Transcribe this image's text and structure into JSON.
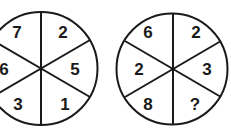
{
  "puzzle": {
    "left_wheel": {
      "segments": [
        "7",
        "2",
        "5",
        "1",
        "3",
        "6"
      ]
    },
    "right_wheel": {
      "segments": [
        "6",
        "2",
        "3",
        "?",
        "8",
        "2"
      ]
    }
  },
  "colors": {
    "stroke": "#1a1a1a",
    "background": "#ffffff"
  }
}
